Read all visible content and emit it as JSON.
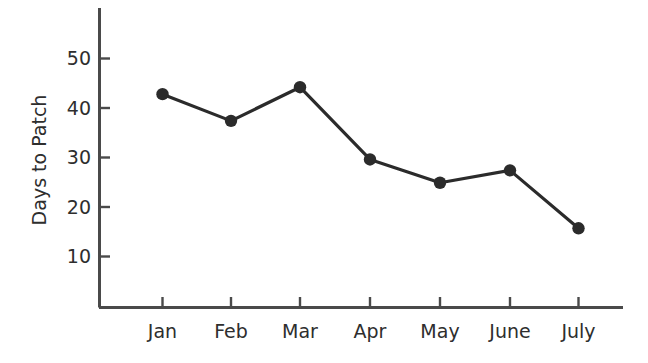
{
  "chart_data": {
    "type": "line",
    "title": "",
    "subtitle": "",
    "xlabel": "",
    "ylabel": "Days to Patch",
    "categories": [
      "Jan",
      "Feb",
      "Mar",
      "Apr",
      "May",
      "June",
      "July"
    ],
    "values": [
      42.8,
      37.4,
      44.2,
      29.6,
      24.9,
      27.4,
      15.7
    ],
    "series": [
      {
        "name": "Days to Patch",
        "values": [
          42.8,
          37.4,
          44.2,
          29.6,
          24.9,
          27.4,
          15.7
        ]
      }
    ],
    "ytick_labels": [
      "10",
      "20",
      "30",
      "40",
      "50"
    ],
    "ytick_values": [
      10,
      20,
      30,
      40,
      50
    ],
    "ylim": [
      0,
      60
    ],
    "xlim": [
      0,
      8
    ],
    "grid": false,
    "legend": false,
    "legend_position": "none",
    "marker": "circle",
    "line_color": "#2b2b2b",
    "marker_color": "#2b2b2b",
    "axis_color": "#4a4a4a",
    "text_color": "#2e2e2e",
    "background_color": "#ffffff"
  },
  "axes": {
    "y_axis_title": "Days to Patch",
    "y_ticks": [
      {
        "label": "50",
        "value": 50
      },
      {
        "label": "40",
        "value": 40
      },
      {
        "label": "30",
        "value": 30
      },
      {
        "label": "20",
        "value": 20
      },
      {
        "label": "10",
        "value": 10
      }
    ],
    "x_ticks": [
      {
        "label": "Jan",
        "value": 42.8
      },
      {
        "label": "Feb",
        "value": 37.4
      },
      {
        "label": "Mar",
        "value": 44.2
      },
      {
        "label": "Apr",
        "value": 29.6
      },
      {
        "label": "May",
        "value": 24.9
      },
      {
        "label": "June",
        "value": 27.4
      },
      {
        "label": "July",
        "value": 15.7
      }
    ]
  }
}
